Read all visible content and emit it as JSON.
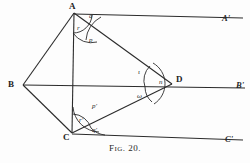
{
  "figure": {
    "caption_prefix": "F",
    "caption_smallcaps": "IG",
    "caption_suffix": ". 20.",
    "caption_full": "Fig. 20.",
    "background_color": "#fdfdfd",
    "ink_color": "#2b2b2b"
  },
  "vertices": [
    {
      "id": "A",
      "label": "A",
      "x": 74,
      "y": 13,
      "label_x": 69,
      "label_y": 2
    },
    {
      "id": "B",
      "label": "B",
      "x": 22,
      "y": 85,
      "label_x": 8,
      "label_y": 80
    },
    {
      "id": "C",
      "label": "C",
      "x": 72,
      "y": 133,
      "label_x": 64,
      "label_y": 133
    },
    {
      "id": "D",
      "label": "D",
      "x": 172,
      "y": 83,
      "label_x": 176,
      "label_y": 76
    }
  ],
  "rays": [
    {
      "id": "A-prime",
      "label": "A'",
      "label_x": 222,
      "label_y": 15,
      "from": "A",
      "to_x": 244,
      "to_y": 18
    },
    {
      "id": "B-prime",
      "label": "B'",
      "label_x": 236,
      "label_y": 82,
      "from": "B",
      "to_x": 246,
      "to_y": 88
    },
    {
      "id": "C-prime",
      "label": "C'",
      "label_x": 225,
      "label_y": 136,
      "from": "C",
      "to_x": 244,
      "to_y": 141
    }
  ],
  "edges": [
    {
      "id": "B-A",
      "from": "B",
      "to": "A"
    },
    {
      "id": "B-C",
      "from": "B",
      "to": "C"
    },
    {
      "id": "A-D",
      "from": "A",
      "to": "D"
    },
    {
      "id": "C-D",
      "from": "C",
      "to": "D"
    },
    {
      "id": "A-C",
      "from": "A",
      "to": "C"
    },
    {
      "id": "B-D",
      "from": "B",
      "to": "D"
    }
  ],
  "angles": {
    "at_A": [
      {
        "id": "q",
        "label": "q",
        "x": 89,
        "y": 15
      },
      {
        "id": "r",
        "label": "r",
        "x": 77,
        "y": 26
      },
      {
        "id": "p",
        "label": "p",
        "x": 89,
        "y": 38
      }
    ],
    "at_D": [
      {
        "id": "iota",
        "label": "ι",
        "x": 138,
        "y": 71
      },
      {
        "id": "n",
        "label": "n",
        "x": 160,
        "y": 81
      },
      {
        "id": "omega",
        "label": "ω",
        "x": 138,
        "y": 94
      }
    ],
    "at_C": [
      {
        "id": "p-prime",
        "label": "p'",
        "x": 92,
        "y": 105
      },
      {
        "id": "r-prime",
        "label": "r'",
        "x": 79,
        "y": 119
      },
      {
        "id": "q-prime",
        "label": "q'",
        "x": 92,
        "y": 128
      }
    ]
  }
}
